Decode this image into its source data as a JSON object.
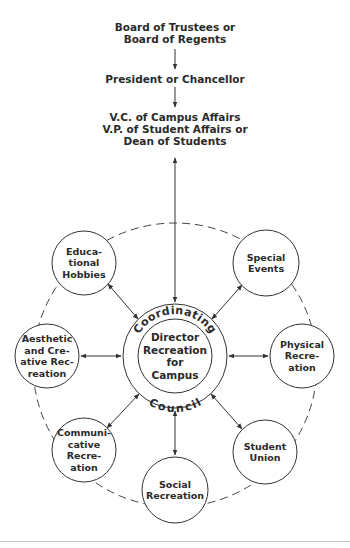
{
  "hierarchy": {
    "level1": [
      "Board of Trustees or",
      "Board of Regents"
    ],
    "level2": [
      "President or Chancellor"
    ],
    "level3": [
      "V.C. of Campus Affairs",
      "V.P. of Student Affairs or",
      "Dean of Students"
    ]
  },
  "center": {
    "ring_top_label": "Coordinating",
    "ring_bottom_label": "Council",
    "inner_label": [
      "Director",
      "Recreation",
      "for",
      "Campus"
    ]
  },
  "nodes": [
    {
      "id": "educational-hobbies",
      "lines": [
        "Educa-",
        "tional",
        "Hobbies"
      ]
    },
    {
      "id": "special-events",
      "lines": [
        "Special",
        "Events"
      ]
    },
    {
      "id": "aesthetic-creative",
      "lines": [
        "Aesthetic",
        "and Cre-",
        "ative Rec-",
        "reation"
      ]
    },
    {
      "id": "physical-recreation",
      "lines": [
        "Physical",
        "Recre-",
        "ation"
      ]
    },
    {
      "id": "communicative-recreation",
      "lines": [
        "Communi-",
        "cative",
        "Recre-",
        "ation"
      ]
    },
    {
      "id": "social-recreation",
      "lines": [
        "Social",
        "Recreation"
      ]
    },
    {
      "id": "student-union",
      "lines": [
        "Student",
        "Union"
      ]
    }
  ],
  "colors": {
    "line": "#333333",
    "text": "#2a2a2a",
    "background": "#ffffff"
  }
}
